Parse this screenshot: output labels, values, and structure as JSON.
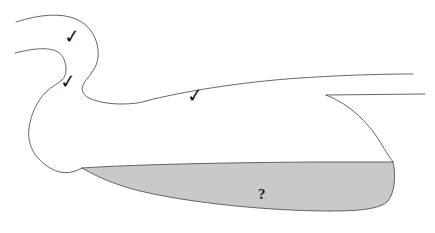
{
  "figure": {
    "background_color": "#ffffff",
    "stroke_color": "#555555",
    "stroke_width": 0.9,
    "shaded_region": {
      "name": "uncertain-region",
      "fill_color": "#c9c9c9",
      "label": "?"
    },
    "annotations": [
      {
        "id": "check-1",
        "glyph": "✓",
        "x": 64,
        "y": 27,
        "name": "checkmark-upper-head"
      },
      {
        "id": "check-2",
        "glyph": "✓",
        "x": 60,
        "y": 72,
        "name": "checkmark-lower-head"
      },
      {
        "id": "check-3",
        "glyph": "✓",
        "x": 187,
        "y": 86,
        "name": "checkmark-back"
      },
      {
        "id": "query-1",
        "glyph": "?",
        "x": 258,
        "y": 187,
        "name": "question-mark-belly"
      }
    ]
  }
}
